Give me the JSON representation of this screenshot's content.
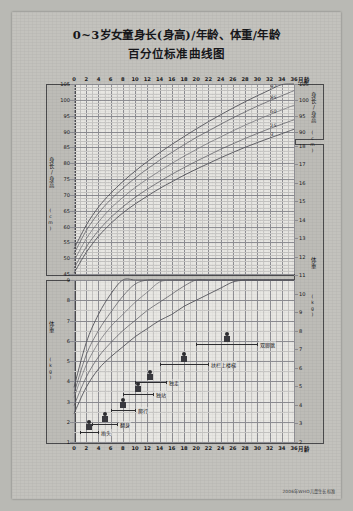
{
  "poster": {
    "title_line1": "0~3岁女童身长(身高)/年龄、体重/年龄",
    "title_line2": "百分位标准曲线图",
    "footer": "2006年WHO儿童生长标准"
  },
  "axes": {
    "x_label": "月龄",
    "x_ticks": [
      0,
      2,
      4,
      6,
      8,
      10,
      12,
      14,
      16,
      18,
      20,
      22,
      24,
      26,
      28,
      30,
      32,
      34,
      36
    ],
    "height_axis_label": "身长/身高",
    "height_axis_unit": "(cm)",
    "height_ticks_left": [
      45,
      50,
      55,
      60,
      65,
      70,
      75,
      80,
      85,
      90,
      95,
      100,
      105
    ],
    "height_ticks_right": [
      90,
      95,
      100,
      105
    ],
    "weight_axis_label": "体重",
    "weight_axis_unit": "(kg)",
    "weight_ticks_left": [
      1,
      2,
      3,
      4,
      5,
      6,
      7,
      8,
      9
    ],
    "weight_ticks_right": [
      2,
      3,
      4,
      5,
      6,
      7,
      8,
      9,
      10,
      11,
      12,
      13,
      14,
      15,
      16,
      17,
      18
    ]
  },
  "percentile_labels": [
    "97",
    "85",
    "50",
    "15",
    "3"
  ],
  "milestones": [
    {
      "name": "抬头",
      "start": 1,
      "end": 4
    },
    {
      "name": "翻身",
      "start": 3,
      "end": 7
    },
    {
      "name": "爬行",
      "start": 6,
      "end": 10
    },
    {
      "name": "独站",
      "start": 8,
      "end": 13
    },
    {
      "name": "独走",
      "start": 10,
      "end": 15
    },
    {
      "name": "扶栏上楼梯",
      "start": 14,
      "end": 22
    },
    {
      "name": "双脚跳",
      "start": 20,
      "end": 30
    }
  ],
  "chart_data": {
    "type": "line",
    "title": "0~3岁女童身长(身高)/年龄、体重/年龄 百分位标准曲线图",
    "xlabel": "月龄",
    "x": [
      0,
      2,
      4,
      6,
      8,
      10,
      12,
      14,
      16,
      18,
      20,
      22,
      24,
      26,
      28,
      30,
      32,
      34,
      36
    ],
    "grid": true,
    "panels": [
      {
        "name": "身长/身高",
        "ylabel": "身长/身高 (cm)",
        "ylim": [
          45,
          105
        ],
        "unit": "cm",
        "series": [
          {
            "name": "97",
            "values": [
              52.9,
              60.4,
              66.1,
              70.5,
              74.2,
              77.5,
              80.5,
              83.3,
              85.9,
              88.4,
              90.8,
              93.1,
              95.3,
              97.4,
              99.4,
              101.3,
              103.1,
              104.8,
              106.5
            ]
          },
          {
            "name": "85",
            "values": [
              51.4,
              58.7,
              64.2,
              68.5,
              72.1,
              75.3,
              78.2,
              80.9,
              83.4,
              85.8,
              88.1,
              90.2,
              92.3,
              94.3,
              96.2,
              98.0,
              99.7,
              101.3,
              102.9
            ]
          },
          {
            "name": "50",
            "values": [
              49.1,
              56.1,
              61.4,
              65.7,
              69.2,
              72.3,
              75.0,
              77.5,
              79.9,
              82.2,
              84.3,
              86.4,
              88.3,
              90.2,
              92.0,
              93.7,
              95.3,
              96.8,
              98.3
            ]
          },
          {
            "name": "15",
            "values": [
              46.8,
              53.5,
              58.7,
              62.8,
              66.2,
              69.2,
              71.8,
              74.2,
              76.5,
              78.6,
              80.6,
              82.5,
              84.4,
              86.1,
              87.8,
              89.4,
              90.9,
              92.3,
              93.7
            ]
          },
          {
            "name": "3",
            "values": [
              45.3,
              51.8,
              56.9,
              60.9,
              64.3,
              67.1,
              69.6,
              72.0,
              74.1,
              76.2,
              78.1,
              79.9,
              81.7,
              83.4,
              85.0,
              86.5,
              87.9,
              89.3,
              90.7
            ]
          }
        ]
      },
      {
        "name": "体重",
        "ylabel": "体重 (kg)",
        "ylim_left": [
          1,
          9
        ],
        "ylim_right": [
          2,
          18
        ],
        "unit": "kg",
        "series": [
          {
            "name": "97",
            "values": [
              3.7,
              5.9,
              7.3,
              8.3,
              9.2,
              9.9,
              10.6,
              11.2,
              11.7,
              12.3,
              12.8,
              13.3,
              13.8,
              14.3,
              14.8,
              15.3,
              15.8,
              16.3,
              16.8
            ]
          },
          {
            "name": "85",
            "values": [
              3.4,
              5.3,
              6.5,
              7.4,
              8.2,
              8.8,
              9.4,
              9.9,
              10.4,
              10.9,
              11.3,
              11.8,
              12.2,
              12.6,
              13.1,
              13.5,
              13.9,
              14.3,
              14.8
            ]
          },
          {
            "name": "50",
            "values": [
              3.2,
              4.8,
              5.9,
              6.7,
              7.3,
              7.9,
              8.4,
              8.9,
              9.3,
              9.8,
              10.2,
              10.6,
              11.0,
              11.3,
              11.7,
              12.1,
              12.4,
              12.8,
              13.1
            ]
          },
          {
            "name": "15",
            "values": [
              2.8,
              4.2,
              5.2,
              5.9,
              6.5,
              7.0,
              7.5,
              7.9,
              8.3,
              8.7,
              9.1,
              9.4,
              9.8,
              10.1,
              10.4,
              10.8,
              11.1,
              11.4,
              11.7
            ]
          },
          {
            "name": "3",
            "values": [
              2.4,
              3.7,
              4.6,
              5.2,
              5.7,
              6.2,
              6.6,
              7.0,
              7.3,
              7.7,
              8.0,
              8.3,
              8.6,
              8.9,
              9.2,
              9.5,
              9.8,
              10.0,
              10.3
            ]
          }
        ]
      }
    ]
  }
}
